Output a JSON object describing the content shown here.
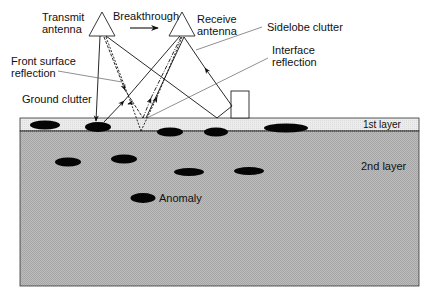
{
  "figure": {
    "type": "ground-penetrating radar signal paths diagram",
    "labels": {
      "transmit_antenna": [
        "Transmit",
        "antenna"
      ],
      "breakthrough": "Breakthrough",
      "receive_antenna": [
        "Receive",
        "antenna"
      ],
      "sidelobe_clutter": "Sidelobe clutter",
      "front_surface_reflection": [
        "Front surface",
        "reflection"
      ],
      "interface_reflection": [
        "Interface",
        "reflection"
      ],
      "ground_clutter": "Ground clutter",
      "layer_1": "1st layer",
      "layer_2": "2nd layer",
      "anomaly": "Anomaly"
    },
    "colors": {
      "background": "#ffffff",
      "layer_1_fill": "#e8e8e8",
      "layer_2_fill": "#b4b4b4",
      "ink": "#111111",
      "ellipse_fill": "#050505"
    },
    "layers": [
      {
        "name": "1st layer",
        "top": 118,
        "bottom": 131
      },
      {
        "name": "2nd layer",
        "top": 131,
        "bottom": 286
      }
    ],
    "layer1_objects": [
      {
        "cx": 45,
        "cy": 125,
        "rx": 15,
        "ry": 4.5
      },
      {
        "cx": 98,
        "cy": 127,
        "rx": 13,
        "ry": 5
      },
      {
        "cx": 170,
        "cy": 132,
        "rx": 13,
        "ry": 4.5
      },
      {
        "cx": 216,
        "cy": 132,
        "rx": 12,
        "ry": 4.5
      },
      {
        "cx": 286,
        "cy": 128,
        "rx": 22,
        "ry": 4.5
      }
    ],
    "layer2_objects": [
      {
        "cx": 68,
        "cy": 162,
        "rx": 13,
        "ry": 4.5
      },
      {
        "cx": 124,
        "cy": 159,
        "rx": 13,
        "ry": 4.5
      },
      {
        "cx": 189,
        "cy": 172,
        "rx": 15,
        "ry": 4
      },
      {
        "cx": 249,
        "cy": 171,
        "rx": 15,
        "ry": 4
      },
      {
        "cx": 143,
        "cy": 198,
        "rx": 12.5,
        "ry": 5,
        "is_anomaly": true
      }
    ]
  }
}
